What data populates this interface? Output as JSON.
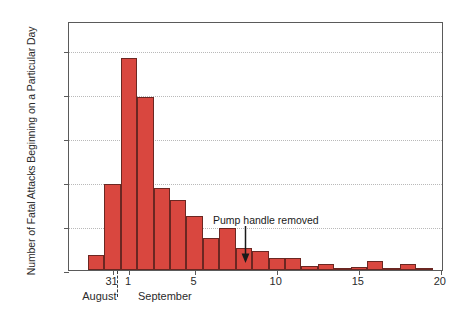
{
  "chart_data": {
    "type": "bar",
    "title": "",
    "subtitle": "",
    "xlabel": "",
    "ylabel": "Number of Fatal Attacks Beginning on a Particular Day",
    "ylim": [
      0,
      170
    ],
    "xlim": [
      29.0,
      20.5
    ],
    "grid": true,
    "legend": null,
    "bar_color": "#d9473f",
    "bar_edge_color": "#6b2722",
    "frame_color": "#5a5a5a",
    "gridline_color": "#b9b9b9",
    "categories": [
      "Aug 30",
      "Aug 31",
      "Sep 1",
      "Sep 2",
      "Sep 3",
      "Sep 4",
      "Sep 5",
      "Sep 6",
      "Sep 7",
      "Sep 8",
      "Sep 9",
      "Sep 10",
      "Sep 11",
      "Sep 12",
      "Sep 13",
      "Sep 14",
      "Sep 15",
      "Sep 16",
      "Sep 17",
      "Sep 18",
      "Sep 19",
      "Sep 20"
    ],
    "values": [
      10,
      59,
      145,
      118,
      56,
      48,
      37,
      22,
      29,
      15,
      13,
      8,
      8,
      3,
      4,
      1,
      2,
      6,
      1,
      4,
      1,
      0
    ],
    "yticks": [
      0,
      30,
      60,
      90,
      120,
      150
    ],
    "ytick_labels": [
      "0",
      "30",
      "60",
      "90",
      "120",
      "150"
    ],
    "xticks": [
      31,
      1,
      5,
      10,
      15,
      20
    ],
    "xtick_labels": [
      "31",
      "1",
      "5",
      "10",
      "15",
      "20"
    ],
    "month_labels": [
      "August",
      "September"
    ],
    "annotations": [
      {
        "text": "Pump handle removed",
        "points_to_day": 8,
        "arrow": "down-arrow"
      }
    ]
  },
  "axis": {
    "y_ticks": [
      {
        "label": "150",
        "value": 150
      },
      {
        "label": "120",
        "value": 120
      },
      {
        "label": "90",
        "value": 90
      },
      {
        "label": "60",
        "value": 60
      },
      {
        "label": "30",
        "value": 30
      },
      {
        "label": "0",
        "value": 0
      }
    ],
    "x_ticks": [
      {
        "label": "31",
        "value": 31
      },
      {
        "label": "1",
        "value": 1
      },
      {
        "label": "5",
        "value": 5
      },
      {
        "label": "10",
        "value": 10
      },
      {
        "label": "15",
        "value": 15
      },
      {
        "label": "20",
        "value": 20
      }
    ],
    "months": [
      {
        "label": "August"
      },
      {
        "label": "September"
      }
    ]
  },
  "annotation": {
    "label": "Pump handle removed"
  }
}
